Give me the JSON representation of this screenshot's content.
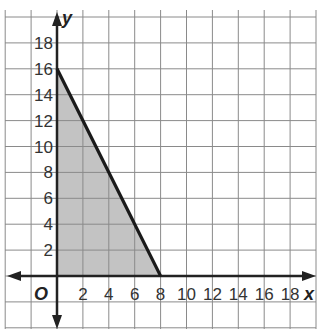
{
  "chart_data": {
    "type": "area",
    "title": "",
    "xlabel": "x",
    "ylabel": "y",
    "origin_label": "O",
    "xlim": [
      -4,
      19
    ],
    "ylim": [
      -4,
      20
    ],
    "grid": true,
    "grid_step": 2,
    "x_ticks": [
      "2",
      "4",
      "6",
      "8",
      "10",
      "12",
      "14",
      "16",
      "18"
    ],
    "y_ticks": [
      "2",
      "4",
      "6",
      "8",
      "10",
      "12",
      "14",
      "16",
      "18"
    ],
    "boundary_line": {
      "points": [
        [
          0,
          16
        ],
        [
          8,
          0
        ]
      ],
      "equation": "2x + y = 16"
    },
    "shaded_region": {
      "vertices": [
        [
          0,
          0
        ],
        [
          0,
          16
        ],
        [
          8,
          0
        ]
      ],
      "color": "#b8b8b8"
    },
    "line_color": "#1a1a1a"
  }
}
